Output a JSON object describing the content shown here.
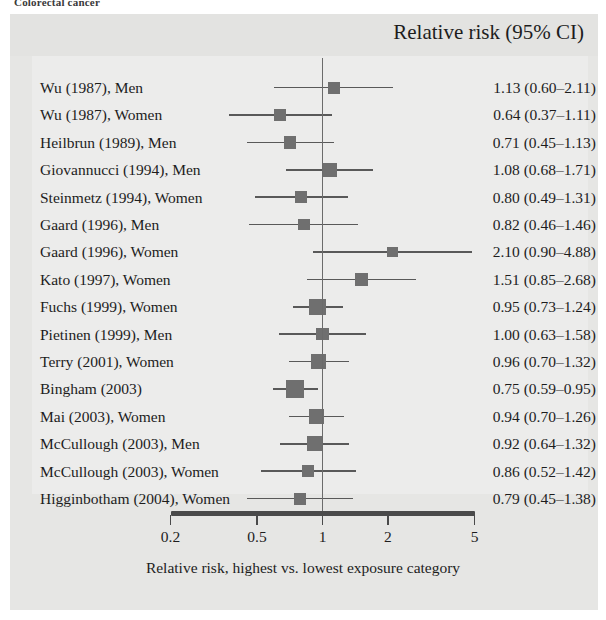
{
  "caption_sliver": "Colorectal cancer",
  "figure": {
    "header_title": "Relative risk (95% CI)",
    "xlabel": "Relative risk, highest vs. lowest exposure category",
    "colors": {
      "panel_background": "#ececeb",
      "figure_background": "#e6e6e4",
      "marker": "#6f6f6f",
      "line": "#595959",
      "axis": "#4a4a4a",
      "text": "#1d1d1d"
    }
  },
  "chart_data": {
    "type": "scatter",
    "subtype": "forest-plot",
    "title": "Relative risk (95% CI)",
    "xlabel": "Relative risk, highest vs. lowest exposure category",
    "ylabel": "",
    "xscale": "log",
    "xlim": [
      0.2,
      5
    ],
    "xticks": [
      0.2,
      0.5,
      1,
      2,
      5
    ],
    "xticklabels": [
      "0.2",
      "0.5",
      "1",
      "2",
      "5"
    ],
    "reference_line": 1,
    "grid": false,
    "legend": "none",
    "categories": [
      "Wu (1987), Men",
      "Wu (1987), Women",
      "Heilbrun (1989), Men",
      "Giovannucci (1994), Men",
      "Steinmetz (1994), Women",
      "Gaard (1996), Men",
      "Gaard (1996), Women",
      "Kato (1997), Women",
      "Fuchs (1999), Women",
      "Pietinen (1999), Men",
      "Terry (2001), Women",
      "Bingham (2003)",
      "Mai (2003), Women",
      "McCullough (2003), Men",
      "McCullough (2003), Women",
      "Higginbotham (2004), Women"
    ],
    "rows": [
      {
        "label": "Wu (1987), Men",
        "rr": 1.13,
        "lo": 0.6,
        "hi": 2.11,
        "value_text": "1.13 (0.60–2.11)",
        "weight": 0.38
      },
      {
        "label": "Wu (1987), Women",
        "rr": 0.64,
        "lo": 0.37,
        "hi": 1.11,
        "value_text": "0.64 (0.37–1.11)",
        "weight": 0.38
      },
      {
        "label": "Heilbrun (1989), Men",
        "rr": 0.71,
        "lo": 0.45,
        "hi": 1.13,
        "value_text": "0.71 (0.45–1.13)",
        "weight": 0.44
      },
      {
        "label": "Giovannucci (1994), Men",
        "rr": 1.08,
        "lo": 0.68,
        "hi": 1.71,
        "value_text": "1.08 (0.68–1.71)",
        "weight": 0.55
      },
      {
        "label": "Steinmetz (1994), Women",
        "rr": 0.8,
        "lo": 0.49,
        "hi": 1.31,
        "value_text": "0.80 (0.49–1.31)",
        "weight": 0.4
      },
      {
        "label": "Gaard (1996), Men",
        "rr": 0.82,
        "lo": 0.46,
        "hi": 1.46,
        "value_text": "0.82 (0.46–1.46)",
        "weight": 0.36
      },
      {
        "label": "Gaard (1996), Women",
        "rr": 2.1,
        "lo": 0.9,
        "hi": 4.88,
        "value_text": "2.10 (0.90–4.88)",
        "weight": 0.26
      },
      {
        "label": "Kato (1997), Women",
        "rr": 1.51,
        "lo": 0.85,
        "hi": 2.68,
        "value_text": "1.51 (0.85–2.68)",
        "weight": 0.42
      },
      {
        "label": "Fuchs (1999), Women",
        "rr": 0.95,
        "lo": 0.73,
        "hi": 1.24,
        "value_text": "0.95 (0.73–1.24)",
        "weight": 0.85
      },
      {
        "label": "Pietinen (1999), Men",
        "rr": 1.0,
        "lo": 0.63,
        "hi": 1.58,
        "value_text": "1.00 (0.63–1.58)",
        "weight": 0.44
      },
      {
        "label": "Terry (2001), Women",
        "rr": 0.96,
        "lo": 0.7,
        "hi": 1.32,
        "value_text": "0.96 (0.70–1.32)",
        "weight": 0.66
      },
      {
        "label": "Bingham (2003)",
        "rr": 0.75,
        "lo": 0.59,
        "hi": 0.95,
        "value_text": "0.75 (0.59–0.95)",
        "weight": 1.0
      },
      {
        "label": "Mai (2003), Women",
        "rr": 0.94,
        "lo": 0.7,
        "hi": 1.26,
        "value_text": "0.94 (0.70–1.26)",
        "weight": 0.72
      },
      {
        "label": "McCullough (2003), Men",
        "rr": 0.92,
        "lo": 0.64,
        "hi": 1.32,
        "value_text": "0.92 (0.64–1.32)",
        "weight": 0.7
      },
      {
        "label": "McCullough (2003), Women",
        "rr": 0.86,
        "lo": 0.52,
        "hi": 1.42,
        "value_text": "0.86 (0.52–1.42)",
        "weight": 0.42
      },
      {
        "label": "Higginbotham (2004), Women",
        "rr": 0.79,
        "lo": 0.45,
        "hi": 1.38,
        "value_text": "0.79 (0.45–1.38)",
        "weight": 0.4
      }
    ],
    "values": [
      1.13,
      0.64,
      0.71,
      1.08,
      0.8,
      0.82,
      2.1,
      1.51,
      0.95,
      1.0,
      0.96,
      0.75,
      0.94,
      0.92,
      0.86,
      0.79
    ]
  }
}
